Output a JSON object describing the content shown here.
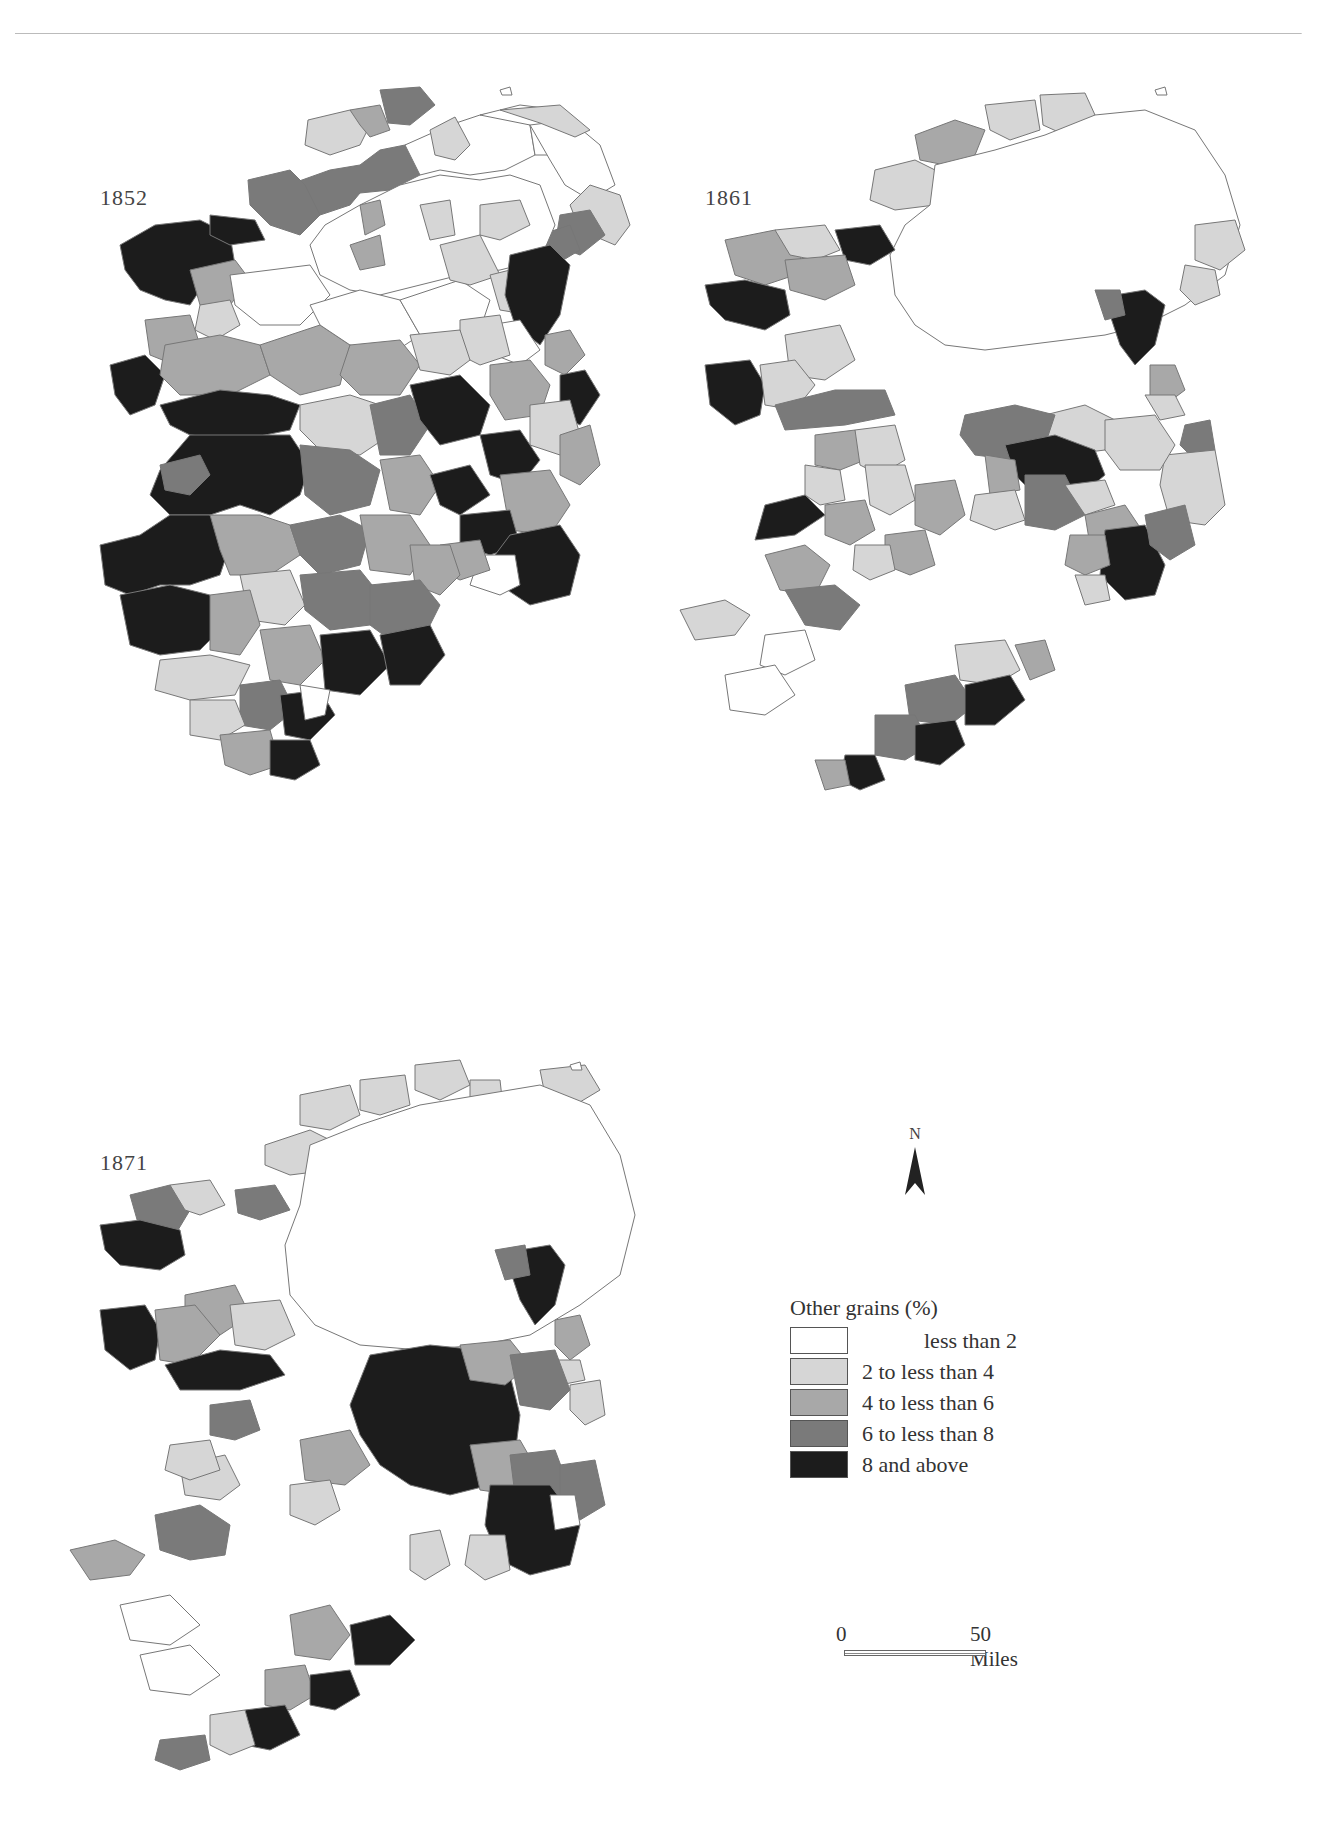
{
  "figure": {
    "type": "choropleth_map_series",
    "region": "Ireland",
    "variable": "Other grains (%)"
  },
  "maps": [
    {
      "year_label": "1852",
      "year": 1852,
      "pattern": "Dominant dark (8 and above) across the west coast (Mayo, Galway, Clare, Kerry), the south coast (Cork), the east (Louth/Dublin area) and parts of the midlands; mid-greys across most of the southern half; north largely white (less than 2)."
    },
    {
      "year_label": "1861",
      "year": 1861,
      "pattern": "Mostly white (less than 2); dark (8 and above) in the west (Mayo, Clare coast), the east coast (Louth/Meath), a midland cluster and the south-east (Wexford) and south coast (Cork)."
    },
    {
      "year_label": "1871",
      "year": 1871,
      "pattern": "Mostly white; a large dark (8 and above) block in the midlands and south-east, plus dark in the east (Louth/Meath), west (Mayo/Galway) and south coast (Cork)."
    }
  ],
  "legend": {
    "title": "Other grains (%)",
    "items": [
      {
        "label": "less than 2",
        "color": "#ffffff"
      },
      {
        "label": "2 to less than 4",
        "color": "#d6d6d6"
      },
      {
        "label": "4 to less than 6",
        "color": "#a8a8a8"
      },
      {
        "label": "6 to less than 8",
        "color": "#7a7a7a"
      },
      {
        "label": "8 and above",
        "color": "#1c1c1c"
      }
    ]
  },
  "north_arrow": {
    "label": "N"
  },
  "scale_bar": {
    "start_label": "0",
    "end_label": "50 Miles"
  },
  "colors": {
    "border": "#777777",
    "class_0": "#ffffff",
    "class_1": "#d6d6d6",
    "class_2": "#a8a8a8",
    "class_3": "#7a7a7a",
    "class_4": "#1c1c1c"
  }
}
